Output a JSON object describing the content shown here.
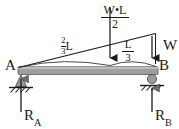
{
  "figure": {
    "type": "free-body-diagram",
    "colors": {
      "beam_fill": "#9e9e9e",
      "beam_stroke": "#4a4a4a",
      "line": "#1a1a1a",
      "background": "#ffffff",
      "support_fill": "#8c8c8c"
    }
  },
  "labels": {
    "point_a": "A",
    "point_b": "B",
    "load_resultant_numerator": "W•L",
    "load_resultant_denominator": "2",
    "distance_left_numerator": "2",
    "distance_left_denominator": "3",
    "distance_left_unit": "L",
    "distance_right_numerator": "L",
    "distance_right_denominator": "3",
    "intensity_w": "W",
    "reaction_a": "R",
    "reaction_a_sub": "A",
    "reaction_b": "R",
    "reaction_b_sub": "B"
  },
  "geometry": {
    "beam": {
      "x1": 18,
      "x2": 158,
      "y": 70,
      "thickness": 8
    },
    "load_triangle": {
      "apex_x": 18,
      "apex_y": 70,
      "peak_x": 155,
      "peak_y": 33
    },
    "resultant_arrow": {
      "x": 110,
      "y_top": 8,
      "y_bottom": 66
    },
    "intensity_arrow": {
      "x": 152,
      "y_top": 33,
      "y_bottom": 66
    },
    "support_a": {
      "x": 21,
      "y": 74,
      "kind": "pin"
    },
    "support_b": {
      "x": 152,
      "y": 74,
      "kind": "roller"
    }
  }
}
